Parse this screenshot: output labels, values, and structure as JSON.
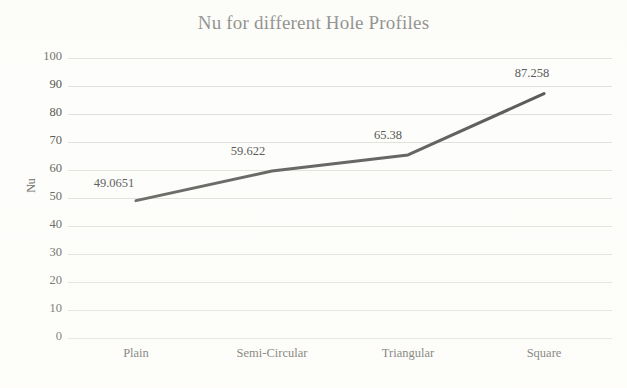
{
  "chart_data": {
    "type": "line",
    "title": "Nu for different Hole Profiles",
    "xlabel": "",
    "ylabel": "Nu",
    "categories": [
      "Plain",
      "Semi-Circular",
      "Triangular",
      "Square"
    ],
    "values": [
      49.0651,
      59.622,
      65.38,
      87.258
    ],
    "data_labels": [
      "49.0651",
      "59.622",
      "65.38",
      "87.258"
    ],
    "ylim": [
      0,
      100
    ],
    "y_ticks": [
      100,
      90,
      80,
      70,
      60,
      50,
      40,
      30,
      20,
      10,
      0
    ],
    "y_tick_labels": [
      "100",
      "90",
      "80",
      "70",
      "60",
      "50",
      "40",
      "30",
      "20",
      "10",
      "0"
    ],
    "grid": "horizontal",
    "legend": "none",
    "series_color": "#595957",
    "gridline_color": "#d9d9d6",
    "text_color": "#55554f",
    "background_color": "#fdfdfb",
    "markers": "none",
    "line_width": 3
  }
}
